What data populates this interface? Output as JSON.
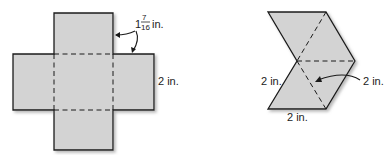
{
  "figure_left": {
    "label_width": "2 in.",
    "label_side_whole": "1",
    "label_side_num": "7",
    "label_side_den": "16",
    "label_side_unit": "in."
  },
  "figure_right": {
    "label_left": "2 in.",
    "label_bottom": "2 in.",
    "label_right": "2 in."
  },
  "colors": {
    "fill": "#d3d3d3",
    "stroke": "#1a1a1a"
  }
}
